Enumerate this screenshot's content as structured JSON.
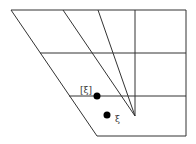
{
  "diagram": {
    "labels": {
      "point_a": "[ξ]",
      "point_b": "ξ"
    },
    "colors": {
      "stroke": "#333333",
      "point": "#000000",
      "background": "#ffffff"
    }
  }
}
